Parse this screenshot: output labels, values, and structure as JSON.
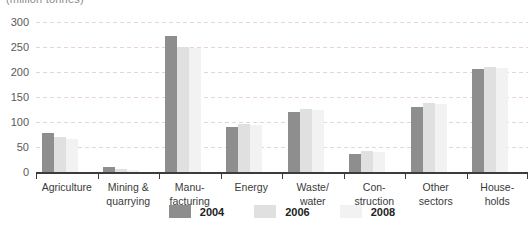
{
  "axis_title": "(million tonnes)",
  "chart_data": {
    "type": "bar",
    "title": "(million tonnes)",
    "categories": [
      "Agriculture",
      "Mining &\nquarrying",
      "Manu-\nfacturing",
      "Energy",
      "Waste/\nwater",
      "Con-\nstruction",
      "Other\nsectors",
      "House-\nholds"
    ],
    "series": [
      {
        "name": "2004",
        "color": "#8e8e8e",
        "values": [
          78,
          10,
          273,
          90,
          121,
          36,
          130,
          206
        ]
      },
      {
        "name": "2006",
        "color": "#e0e0e0",
        "values": [
          71,
          6,
          251,
          97,
          126,
          43,
          139,
          211
        ]
      },
      {
        "name": "2008",
        "color": "#f2f2f2",
        "values": [
          66,
          4,
          248,
          95,
          124,
          41,
          137,
          208
        ]
      }
    ],
    "ylim": [
      0,
      300
    ],
    "yticks": [
      0,
      50,
      100,
      150,
      200,
      250,
      300
    ],
    "grid": "dashed horizontal",
    "grid_color": "#e8d4d4",
    "axis_color": "#3c3c3c",
    "legend_position": "bottom"
  }
}
